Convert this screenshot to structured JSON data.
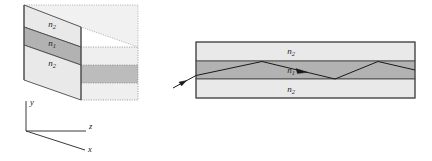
{
  "figure": {
    "background_color": "#ffffff"
  },
  "colors": {
    "cladding_fill": "#e9e9e9",
    "core_fill": "#b2b2b2",
    "top_face_fill": "#ededed",
    "outline": "#4a4a4a",
    "dotted_outline": "#8c8c8c",
    "ray_stroke": "#1a1a1a",
    "axis_stroke": "#3a3a3a",
    "label_color": "#1a1a1a"
  },
  "slab_3d": {
    "name": "three-dimensional slab waveguide",
    "layers": [
      {
        "id": "upper-cladding",
        "symbol": "n",
        "subscript": "2",
        "label": "n2",
        "role": "cladding",
        "fill": "#e9e9e9"
      },
      {
        "id": "guiding-film",
        "symbol": "n",
        "subscript": "1",
        "label": "n1",
        "role": "core",
        "fill": "#b2b2b2"
      },
      {
        "id": "lower-cladding",
        "symbol": "n",
        "subscript": "2",
        "label": "n2",
        "role": "cladding",
        "fill": "#e9e9e9"
      }
    ]
  },
  "cross_section": {
    "name": "cross-sectional side view",
    "layers": [
      {
        "id": "upper-cladding",
        "symbol": "n",
        "subscript": "2",
        "label": "n2",
        "role": "cladding",
        "fill": "#e9e9e9"
      },
      {
        "id": "guiding-film",
        "symbol": "n",
        "subscript": "1",
        "label": "n1",
        "role": "core",
        "fill": "#b2b2b2"
      },
      {
        "id": "lower-cladding",
        "symbol": "n",
        "subscript": "2",
        "label": "n2",
        "role": "cladding",
        "fill": "#e9e9e9"
      }
    ],
    "ray": {
      "id": "guided-ray",
      "description": "ray launched from outside, guided by total internal reflection",
      "arrowheads": 3
    }
  },
  "axes": {
    "name": "coordinate axes",
    "items": [
      {
        "id": "y-axis",
        "label": "y",
        "direction": "up"
      },
      {
        "id": "z-axis",
        "label": "z",
        "direction": "right"
      },
      {
        "id": "x-axis",
        "label": "x",
        "direction": "down-right"
      }
    ]
  }
}
